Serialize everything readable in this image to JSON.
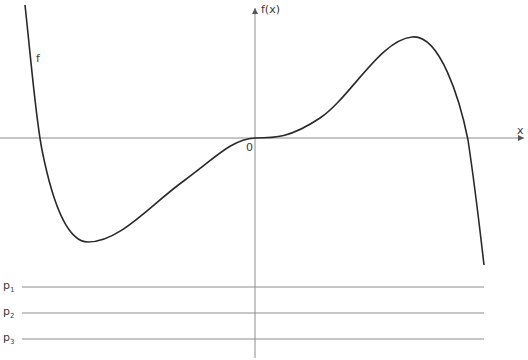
{
  "diagram": {
    "function_label": "f",
    "y_axis_label": "f(x)",
    "x_axis_label": "x",
    "origin_label": "0",
    "lines": [
      {
        "label": "p",
        "subscript": "1"
      },
      {
        "label": "p",
        "subscript": "2"
      },
      {
        "label": "p",
        "subscript": "3"
      }
    ],
    "colors": {
      "curve": "#2a2a2a",
      "axis": "#8c8c8c",
      "lines": "#8c8c8c"
    }
  }
}
